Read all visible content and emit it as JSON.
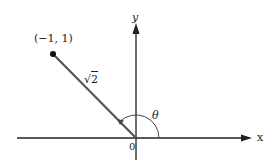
{
  "diagram": {
    "point_label": "(−1, 1)",
    "segment_length_label": {
      "radical": "√",
      "radicand": "2"
    },
    "angle_label": "θ",
    "origin_label": "0",
    "x_axis_label": "x",
    "y_axis_label": "y",
    "colors": {
      "axes": "#222222",
      "segment": "#555555",
      "point": "#111111",
      "arc": "#444444"
    }
  }
}
